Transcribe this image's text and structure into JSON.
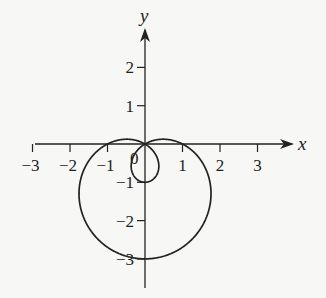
{
  "chart_data": {
    "type": "line",
    "title": "",
    "curve": "polar limacon r = 1 - 2 sin(theta), inner loop",
    "equation": "r = 1 - 2 sin θ",
    "xlabel": "x",
    "ylabel": "y",
    "xlim": [
      -3,
      3
    ],
    "ylim": [
      -3,
      2
    ],
    "x_ticks": [
      -3,
      -2,
      -1,
      1,
      2,
      3
    ],
    "x_tick_labels": [
      "−3",
      "−2",
      "−1",
      "1",
      "2",
      "3"
    ],
    "y_ticks": [
      2,
      1,
      -1,
      -2,
      -3
    ],
    "y_tick_labels": [
      "2",
      "1",
      "−1",
      "−2",
      "−3"
    ],
    "origin_label": "0",
    "grid": false,
    "key_points": [
      {
        "x": 1,
        "y": 0
      },
      {
        "x": -1,
        "y": 0
      },
      {
        "x": 0,
        "y": -3
      },
      {
        "x": 0,
        "y": -1
      },
      {
        "x": 0,
        "y": 0
      }
    ],
    "series": [
      {
        "name": "r = 1 - 2 sin θ",
        "color": "#222222"
      }
    ]
  },
  "style": {
    "line_color": "#222222",
    "background": "#f7f7f5"
  }
}
